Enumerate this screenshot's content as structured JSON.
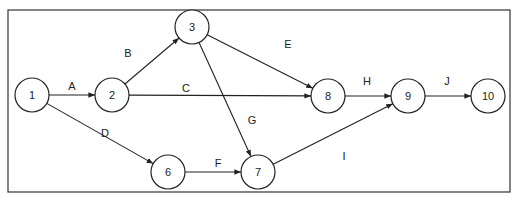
{
  "diagram": {
    "type": "activity-on-arrow network",
    "nodes": [
      {
        "id": "1",
        "label": "1",
        "x": 32,
        "y": 95
      },
      {
        "id": "2",
        "label": "2",
        "x": 112,
        "y": 95
      },
      {
        "id": "3",
        "label": "3",
        "x": 192,
        "y": 27
      },
      {
        "id": "6",
        "label": "6",
        "x": 168,
        "y": 172
      },
      {
        "id": "7",
        "label": "7",
        "x": 258,
        "y": 172
      },
      {
        "id": "8",
        "label": "8",
        "x": 328,
        "y": 96
      },
      {
        "id": "9",
        "label": "9",
        "x": 408,
        "y": 96
      },
      {
        "id": "10",
        "label": "10",
        "x": 488,
        "y": 96
      }
    ],
    "edges": [
      {
        "label": "A",
        "from": "1",
        "to": "2",
        "lx": 72,
        "ly": 86
      },
      {
        "label": "B",
        "from": "2",
        "to": "3",
        "lx": 128,
        "ly": 53
      },
      {
        "label": "C",
        "from": "2",
        "to": "8",
        "lx": 186,
        "ly": 88
      },
      {
        "label": "D",
        "from": "1",
        "to": "6",
        "lx": 105,
        "ly": 133
      },
      {
        "label": "E",
        "from": "3",
        "to": "8",
        "lx": 288,
        "ly": 44
      },
      {
        "label": "F",
        "from": "6",
        "to": "7",
        "lx": 218,
        "ly": 163
      },
      {
        "label": "G",
        "from": "3",
        "to": "7",
        "lx": 252,
        "ly": 120
      },
      {
        "label": "H",
        "from": "8",
        "to": "9",
        "lx": 367,
        "ly": 81
      },
      {
        "label": "I",
        "from": "7",
        "to": "9",
        "lx": 344,
        "ly": 156
      },
      {
        "label": "J",
        "from": "9",
        "to": "10",
        "lx": 447,
        "ly": 81
      }
    ]
  }
}
